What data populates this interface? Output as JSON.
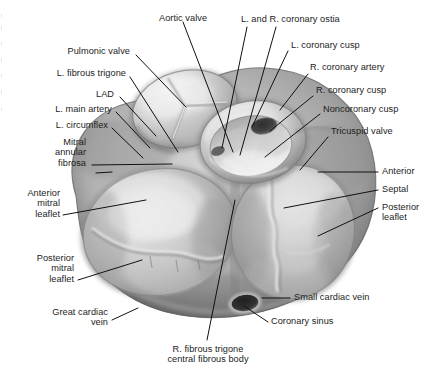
{
  "figure": {
    "view": "superior view of cardiac skeleton with atria removed",
    "style": "grayscale medical illustration",
    "background_color": "#ffffff",
    "line_color": "#111111",
    "text_color": "#1c1c1c"
  },
  "labels": [
    {
      "id": "aortic-valve",
      "text": "Aortic valve",
      "align": "center"
    },
    {
      "id": "coronary-ostia",
      "text": "L. and R. coronary ostia",
      "align": "left"
    },
    {
      "id": "l-coronary-cusp",
      "text": "L. coronary cusp",
      "align": "left"
    },
    {
      "id": "r-coronary-artery",
      "text": "R. coronary artery",
      "align": "left"
    },
    {
      "id": "r-coronary-cusp",
      "text": "R. coronary cusp",
      "align": "left"
    },
    {
      "id": "noncoronary-cusp",
      "text": "Noncoronary cusp",
      "align": "left"
    },
    {
      "id": "tricuspid-valve",
      "text": "Tricuspid valve",
      "align": "left"
    },
    {
      "id": "pulmonic-valve",
      "text": "Pulmonic valve",
      "align": "right"
    },
    {
      "id": "l-fibrous-trigone",
      "text": "L. fibrous trigone",
      "align": "right"
    },
    {
      "id": "lad",
      "text": "LAD",
      "align": "right"
    },
    {
      "id": "l-main-artery",
      "text": "L. main artery",
      "align": "right"
    },
    {
      "id": "l-circumflex",
      "text": "L. circumflex",
      "align": "right"
    },
    {
      "id": "mitral-annular-fibrosa",
      "text": "Mitral\nannular\nfibrosa",
      "align": "right"
    },
    {
      "id": "anterior-mitral-leaflet",
      "text": "Anterior\nmitral\nleaflet",
      "align": "right"
    },
    {
      "id": "posterior-mitral-leaflet",
      "text": "Posterior\nmitral\nleaflet",
      "align": "right"
    },
    {
      "id": "great-cardiac-vein",
      "text": "Great cardiac\nvein",
      "align": "right"
    },
    {
      "id": "anterior",
      "text": "Anterior",
      "align": "left"
    },
    {
      "id": "septal",
      "text": "Septal",
      "align": "left"
    },
    {
      "id": "posterior-leaflet",
      "text": "Posterior\nleaflet",
      "align": "left"
    },
    {
      "id": "small-cardiac-vein",
      "text": "Small cardiac vein",
      "align": "left"
    },
    {
      "id": "coronary-sinus",
      "text": "Coronary sinus",
      "align": "left"
    },
    {
      "id": "r-fibrous-trigone",
      "text": "R. fibrous trigone\ncentral fibrous body",
      "align": "center"
    }
  ],
  "structures": [
    {
      "id": "heart-base-mass",
      "name": "base of heart / cardiac skeleton"
    },
    {
      "id": "aortic-valve-ring",
      "name": "aortic valve annulus with three cusps"
    },
    {
      "id": "pulmonic-valve-ring",
      "name": "pulmonic valve with three leaflets"
    },
    {
      "id": "mitral-valve-orifice",
      "name": "mitral valve orifice"
    },
    {
      "id": "tricuspid-valve-orifice",
      "name": "tricuspid valve orifice"
    },
    {
      "id": "coronary-sinus-ostium",
      "name": "coronary sinus ostium"
    },
    {
      "id": "coronary-ostium-dark",
      "name": "coronary ostium opening"
    }
  ]
}
